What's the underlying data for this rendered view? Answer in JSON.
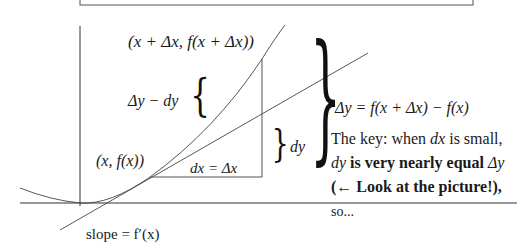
{
  "top_box": {
    "text": ""
  },
  "labels": {
    "upper_point": "(x + Δx, f(x + Δx))",
    "gap": "Δy − dy",
    "dy": "dy",
    "point": "(x, f(x))",
    "dx": "dx = Δx",
    "slope": "slope = f′(x)"
  },
  "explanation": {
    "delta_y_def": "Δy = f(x + Δx) − f(x)",
    "line1_prefix": "The key: when ",
    "line1_var": "dx",
    "line1_suffix": " is small,",
    "line2_var": "dy",
    "line2_bold": " is very nearly equal ",
    "line2_var2": "Δy",
    "line3": "(← Look at the picture!),",
    "line4": "so..."
  },
  "colors": {
    "stroke": "#333333",
    "curve": "#555555",
    "text": "#1a1a1a"
  }
}
